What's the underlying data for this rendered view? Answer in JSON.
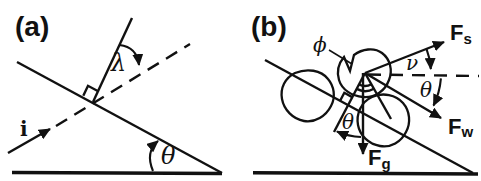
{
  "panel_a": {
    "label": "(a)",
    "i_label": "i",
    "lambda_label": "λ",
    "theta_label": "θ"
  },
  "panel_b": {
    "label": "(b)",
    "phi_label": "ϕ",
    "nu_label": "ν",
    "theta_flow_label": "θ",
    "theta_slope_label": "θ",
    "fs": {
      "base": "F",
      "sub": "s"
    },
    "fw": {
      "base": "F",
      "sub": "w"
    },
    "fg": {
      "base": "F",
      "sub": "g"
    }
  },
  "colors": {
    "ink": "#111111",
    "background": "#ffffff"
  }
}
